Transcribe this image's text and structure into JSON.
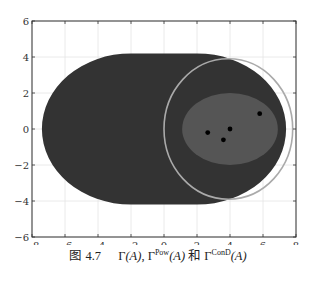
{
  "chart_data": {
    "type": "scatter",
    "title": "",
    "xlabel": "",
    "ylabel": "",
    "xlim": [
      -8,
      8
    ],
    "ylim": [
      -6,
      6
    ],
    "grid": true,
    "x_ticks": [
      -8,
      -6,
      -4,
      -2,
      0,
      2,
      4,
      6,
      8
    ],
    "y_ticks": [
      -6,
      -4,
      -2,
      0,
      2,
      4,
      6
    ],
    "x_tick_labels": [
      "−8",
      "−6",
      "−4",
      "−2",
      "0",
      "2",
      "4",
      "6",
      "8"
    ],
    "y_tick_labels": [
      "−6",
      "−4",
      "−2",
      "0",
      "2",
      "4",
      "6"
    ],
    "regions": [
      {
        "name": "Γ(A)",
        "shape": "stadium",
        "x_range": [
          -7.4,
          7.4
        ],
        "y_range": [
          -4.2,
          4.2
        ],
        "flat_top_x_range": [
          -2.0,
          2.0
        ],
        "fill": "#333333"
      },
      {
        "name": "Γ^ConD(A)",
        "shape": "ellipse",
        "center": [
          4.0,
          0.0
        ],
        "rx": 2.9,
        "ry": 2.0,
        "fill": "#555555"
      },
      {
        "name": "Γ^Pow(A)",
        "shape": "circle",
        "center": [
          3.9,
          0.0
        ],
        "r": 3.9,
        "stroke": "#aaaaaa"
      }
    ],
    "series": [
      {
        "name": "A",
        "points": [
          [
            2.65,
            -0.2
          ],
          [
            4.0,
            0.0
          ],
          [
            3.6,
            -0.6
          ],
          [
            5.8,
            0.85
          ]
        ],
        "color": "#000000"
      }
    ],
    "caption": {
      "figure_number": "图 4.7",
      "gamma": "Γ",
      "arg": "(A)",
      "sep": ", ",
      "pow_sup": "Pow",
      "and": " 和 ",
      "cond_sup": "ConD"
    }
  }
}
